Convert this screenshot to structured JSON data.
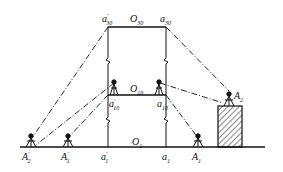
{
  "diagram": {
    "type": "surveying-transfer-diagram",
    "labels": {
      "top_left": {
        "base": "a",
        "prime": "'",
        "sub": "30"
      },
      "top_center": {
        "base": "O",
        "sub": "30"
      },
      "top_right": {
        "base": "a",
        "sub": "30"
      },
      "mid_left": {
        "base": "a",
        "prime": "'",
        "sub": "10"
      },
      "mid_center": {
        "base": "O",
        "sub": "10"
      },
      "mid_right": {
        "base": "a",
        "sub": "10"
      },
      "ground_center": {
        "base": "O",
        "sub": "1"
      },
      "A2_roof": {
        "base": "A",
        "sub": "2"
      },
      "A2_prime": {
        "base": "A",
        "prime": "'",
        "sub": "2"
      },
      "A1_prime": {
        "base": "A",
        "prime": "'",
        "sub": "1"
      },
      "a1_prime": {
        "base": "a",
        "prime": "'",
        "sub": "1"
      },
      "a1": {
        "base": "a",
        "sub": "1"
      },
      "A1": {
        "base": "A",
        "sub": "1"
      }
    },
    "colors": {
      "line": "#111111",
      "background": "#ffffff"
    }
  }
}
